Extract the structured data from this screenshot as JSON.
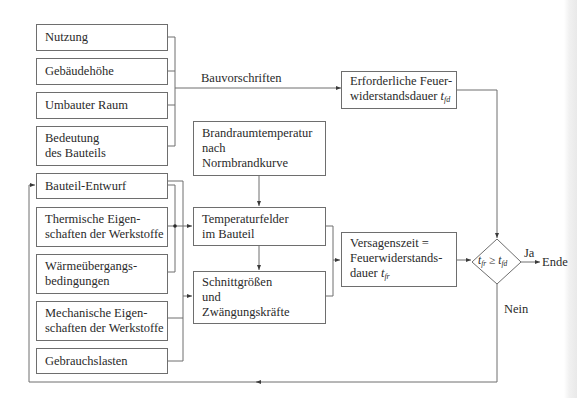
{
  "diagram": {
    "inputs_requirements": [
      {
        "id": "nutzung",
        "lines": [
          "Nutzung"
        ]
      },
      {
        "id": "gebaeudehoehe",
        "lines": [
          "Gebäudehöhe"
        ]
      },
      {
        "id": "umbauter-raum",
        "lines": [
          "Umbauter Raum"
        ]
      },
      {
        "id": "bedeutung",
        "lines": [
          "Bedeutung",
          "des Bauteils"
        ]
      }
    ],
    "inputs_design": [
      {
        "id": "bauteil-entwurf",
        "lines": [
          "Bauteil-Entwurf"
        ]
      },
      {
        "id": "thermische",
        "lines": [
          "Thermische Eigen-",
          "schaften der Werkstoffe"
        ]
      },
      {
        "id": "waermeuebergang",
        "lines": [
          "Wärmeübergangs-",
          "bedingungen"
        ]
      },
      {
        "id": "mechanische",
        "lines": [
          "Mechanische Eigen-",
          "schaften der Werkstoffe"
        ]
      },
      {
        "id": "gebrauchslasten",
        "lines": [
          "Gebrauchslasten"
        ]
      }
    ],
    "process": {
      "brandraum": [
        "Brandraumtemperatur",
        "nach",
        "Normbrandkurve"
      ],
      "temperaturfelder": [
        "Temperaturfelder",
        "im Bauteil"
      ],
      "schnittgroessen": [
        "Schnittgrößen",
        "und",
        "Zwängungskräfte"
      ]
    },
    "required": {
      "line1": "Erforderliche Feuer-",
      "line2_text": "widerstandsdauer ",
      "symbol": "t",
      "symbol_sub": "fd"
    },
    "failure": {
      "line1": "Versagenszeit =",
      "line2": "Feuerwiderstands-",
      "line3_text": "dauer ",
      "symbol": "t",
      "symbol_sub": "fr"
    },
    "decision": {
      "lhs": "t",
      "lhs_sub": "fr",
      "operator": " ≥ ",
      "rhs": "t",
      "rhs_sub": "fd"
    },
    "edge_labels": {
      "bauvorschriften": "Bauvorschriften",
      "ja": "Ja",
      "nein": "Nein",
      "ende": "Ende"
    },
    "colors": {
      "line": "#6e6e6e",
      "text": "#2a2a2a",
      "background": "#ffffff"
    }
  }
}
